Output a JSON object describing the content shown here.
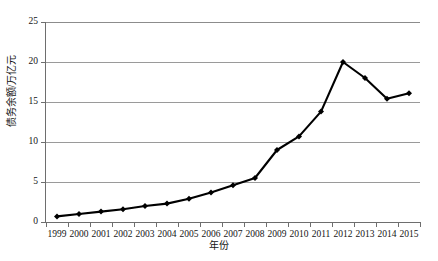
{
  "chart_data": {
    "type": "line",
    "title": "",
    "xlabel": "年份",
    "ylabel": "债务余额/万亿元",
    "categories": [
      "1999",
      "2000",
      "2001",
      "2002",
      "2003",
      "2004",
      "2005",
      "2006",
      "2007",
      "2008",
      "2009",
      "2010",
      "2011",
      "2012",
      "2013",
      "2014",
      "2015"
    ],
    "values": [
      0.7,
      1.0,
      1.3,
      1.6,
      2.0,
      2.3,
      2.9,
      3.7,
      4.6,
      5.5,
      9.0,
      10.7,
      13.8,
      20.0,
      18.0,
      15.4,
      16.1
    ],
    "series": [
      {
        "name": "债务余额",
        "values": [
          0.7,
          1.0,
          1.3,
          1.6,
          2.0,
          2.3,
          2.9,
          3.7,
          4.6,
          5.5,
          9.0,
          10.7,
          13.8,
          20.0,
          18.0,
          15.4,
          16.1
        ]
      }
    ],
    "ylim": [
      0,
      25
    ],
    "yticks": [
      0,
      5,
      10,
      15,
      20,
      25
    ],
    "ytick_labels": [
      "0",
      "5",
      "10",
      "15",
      "20",
      "25"
    ],
    "grid": true,
    "grid_axis": "y",
    "legend": false,
    "legend_position": "none",
    "marker": "diamond",
    "line_color": "#000000",
    "marker_color": "#000000",
    "grid_color": "#9a9a9a",
    "axis_color": "#6e6e6e",
    "background": "#ffffff"
  }
}
